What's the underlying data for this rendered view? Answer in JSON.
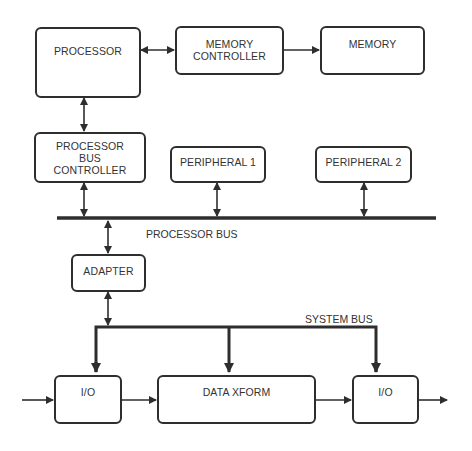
{
  "diagram": {
    "blocks": {
      "processor": "PROCESSOR",
      "memory_controller": [
        "MEMORY",
        "CONTROLLER"
      ],
      "memory": "MEMORY",
      "processor_bus_controller": [
        "PROCESSOR",
        "BUS",
        "CONTROLLER"
      ],
      "peripheral_1": "PERIPHERAL 1",
      "peripheral_2": "PERIPHERAL 2",
      "adapter": "ADAPTER",
      "io_left": "I/O",
      "data_xform": "DATA XFORM",
      "io_right": "I/O"
    },
    "buses": {
      "processor_bus": "PROCESSOR BUS",
      "system_bus": "SYSTEM BUS"
    },
    "connections": [
      {
        "from": "processor",
        "to": "memory_controller",
        "type": "bidirectional"
      },
      {
        "from": "memory_controller",
        "to": "memory",
        "type": "unidirectional"
      },
      {
        "from": "processor",
        "to": "processor_bus_controller",
        "type": "bidirectional"
      },
      {
        "from": "processor_bus_controller",
        "to": "processor_bus",
        "type": "bidirectional"
      },
      {
        "from": "peripheral_1",
        "to": "processor_bus",
        "type": "bidirectional"
      },
      {
        "from": "peripheral_2",
        "to": "processor_bus",
        "type": "bidirectional"
      },
      {
        "from": "processor_bus",
        "to": "adapter",
        "type": "bidirectional"
      },
      {
        "from": "adapter",
        "to": "system_bus",
        "type": "bidirectional"
      },
      {
        "from": "system_bus",
        "to": "io_left",
        "type": "unidirectional"
      },
      {
        "from": "system_bus",
        "to": "data_xform",
        "type": "unidirectional"
      },
      {
        "from": "system_bus",
        "to": "io_right",
        "type": "unidirectional"
      },
      {
        "from": "input",
        "to": "io_left",
        "type": "unidirectional"
      },
      {
        "from": "io_left",
        "to": "data_xform",
        "type": "unidirectional"
      },
      {
        "from": "data_xform",
        "to": "io_right",
        "type": "unidirectional"
      },
      {
        "from": "io_right",
        "to": "output",
        "type": "unidirectional"
      }
    ],
    "colors": {
      "line": "#2e2e2e",
      "background": "#ffffff"
    }
  }
}
